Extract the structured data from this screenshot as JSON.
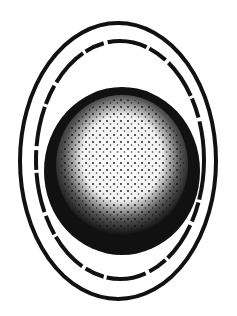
{
  "figure": {
    "colors": {
      "ink": "#111111",
      "paper": "#ffffff"
    },
    "outer_ring": {
      "cx": 118,
      "cy": 161,
      "rx": 98,
      "ry": 138
    },
    "inner_ring": {
      "cx": 120,
      "cy": 160,
      "rx": 84,
      "ry": 119
    },
    "disc": {
      "cx": 122,
      "cy": 171,
      "rx": 78,
      "ry": 84
    }
  }
}
